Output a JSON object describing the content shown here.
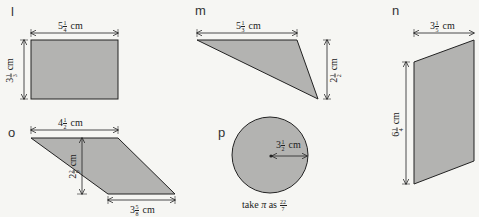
{
  "colors": {
    "background": "#f6f6f3",
    "shape_fill": "#b3b3b1",
    "stroke": "#222222"
  },
  "shapes": {
    "l": {
      "letter": "l",
      "type": "rectangle",
      "width": {
        "whole": "5",
        "num": "1",
        "den": "4",
        "unit": "cm"
      },
      "height": {
        "whole": "3",
        "num": "1",
        "den": "3",
        "unit": "cm"
      }
    },
    "m": {
      "letter": "m",
      "type": "triangle",
      "base": {
        "whole": "5",
        "num": "1",
        "den": "3",
        "unit": "cm"
      },
      "height": {
        "whole": "2",
        "num": "1",
        "den": "2",
        "unit": "cm"
      }
    },
    "n": {
      "letter": "n",
      "type": "parallelogram",
      "width": {
        "whole": "3",
        "num": "1",
        "den": "5",
        "unit": "cm"
      },
      "height": {
        "whole": "6",
        "num": "1",
        "den": "4",
        "unit": "cm"
      }
    },
    "o": {
      "letter": "o",
      "type": "parallelogram",
      "top": {
        "whole": "4",
        "num": "1",
        "den": "2",
        "unit": "cm"
      },
      "height": {
        "whole": "2",
        "num": "2",
        "den": "9",
        "unit": "cm"
      },
      "bottom": {
        "whole": "3",
        "num": "5",
        "den": "8",
        "unit": "cm"
      }
    },
    "p": {
      "letter": "p",
      "type": "circle",
      "radius": {
        "whole": "3",
        "num": "1",
        "den": "2",
        "unit": "cm"
      },
      "note_prefix": "take",
      "note_symbol": "π",
      "note_mid": "as",
      "note_num": "22",
      "note_den": "7"
    }
  }
}
